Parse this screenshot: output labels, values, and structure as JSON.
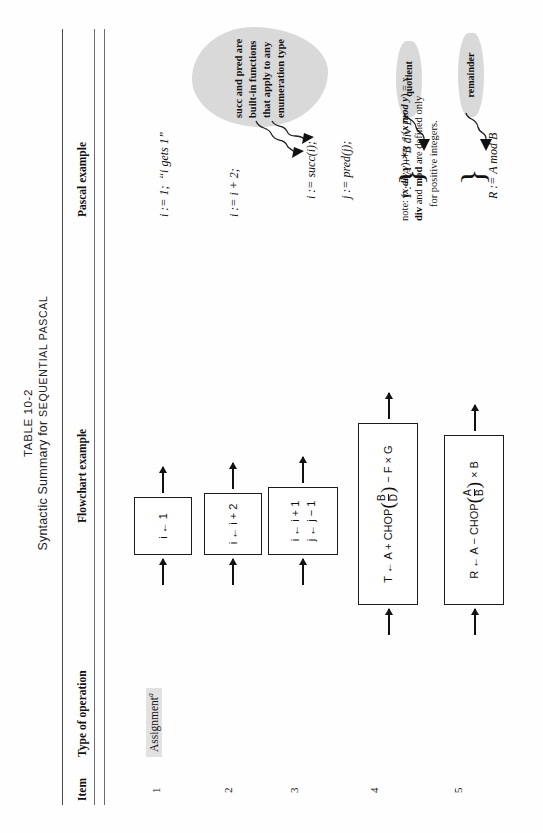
{
  "table": {
    "label": "TABLE 10-2",
    "subtitle_plain": "Syntactic Summary for ",
    "subtitle_smallcaps": "SEQUENTIAL PASCAL",
    "headers": {
      "item": "Item",
      "type_of_operation": "Type of operation",
      "flowchart_example": "Flowchart example",
      "pascal_example": "Pascal example"
    },
    "rows": [
      {
        "item": "1",
        "type_of_operation": "Assignment",
        "type_of_operation_note": "a",
        "flowchart": [
          "i ← 1"
        ],
        "pascal": [
          "i := 1;  “i gets 1”"
        ]
      },
      {
        "item": "2",
        "type_of_operation": "",
        "flowchart": [
          "i ← i + 2"
        ],
        "pascal": [
          "i := i + 2;"
        ]
      },
      {
        "item": "3",
        "type_of_operation": "",
        "flowchart": [
          "i ← i + 1",
          "j ← j − 1"
        ],
        "pascal": [
          "i := succ(i);",
          "j := pred(j);"
        ]
      },
      {
        "item": "4",
        "type_of_operation": "",
        "flowchart_prefix": "T ← A + CHOP",
        "flowchart_frac_num": "B",
        "flowchart_frac_den": "D",
        "flowchart_suffix": "− F × G",
        "pascal_rich": "T := A + B div D − F*G"
      },
      {
        "item": "5",
        "type_of_operation": "",
        "flowchart_prefix": "R ← A − CHOP",
        "flowchart_frac_num": "A",
        "flowchart_frac_den": "B",
        "flowchart_suffix": "× B",
        "pascal_rich": "R := A mod B"
      }
    ]
  },
  "annotations": {
    "succ_pred_cloud": "succ and pred are built-in functions that apply to any enumeration type",
    "quotient_cloud": "quotient",
    "remainder_cloud": "remainder",
    "note_line1_a": "note: (",
    "note_line1_b": "x div y",
    "note_line1_c": ") ∗y + (",
    "note_line1_d": "x mod y",
    "note_line1_e": ") = x.",
    "note_line2_a": "div",
    "note_line2_b": " and ",
    "note_line2_c": "mod",
    "note_line2_d": " are defined only",
    "note_line3": "for positive integers."
  }
}
